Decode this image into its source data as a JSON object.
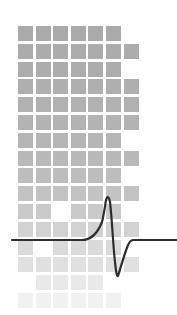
{
  "graphic": {
    "description": "Grid of gray squares fading toward bottom with a spike waveform line",
    "grid": {
      "left": 18,
      "top": 26,
      "pitch_x": 17.6,
      "pitch_y": 17.8,
      "size": 15,
      "rows": [
        {
          "cols": [
            0,
            1,
            2,
            3,
            4,
            5
          ],
          "shade": "#aaaaaa"
        },
        {
          "cols": [
            0,
            1,
            2,
            3,
            4,
            5,
            6
          ],
          "shade": "#acacac"
        },
        {
          "cols": [
            0,
            1,
            2,
            3,
            4,
            5
          ],
          "shade": "#adadad"
        },
        {
          "cols": [
            0,
            1,
            2,
            3,
            4,
            5,
            6
          ],
          "shade": "#afafaf"
        },
        {
          "cols": [
            0,
            1,
            2,
            3,
            4,
            5,
            6
          ],
          "shade": "#b1b1b1"
        },
        {
          "cols": [
            0,
            1,
            2,
            3,
            4,
            5,
            6
          ],
          "shade": "#b3b3b3"
        },
        {
          "cols": [
            0,
            1,
            2,
            3,
            4,
            5
          ],
          "shade": "#b6b6b6"
        },
        {
          "cols": [
            0,
            1,
            2,
            3,
            4,
            5,
            6
          ],
          "shade": "#b9b9b9"
        },
        {
          "cols": [
            0,
            1,
            2,
            3,
            4,
            5
          ],
          "shade": "#bdbdbd"
        },
        {
          "cols": [
            0,
            1,
            2,
            3,
            4,
            5,
            6
          ],
          "shade": "#c3c3c3"
        },
        {
          "cols": [
            0,
            1,
            3,
            4,
            5
          ],
          "shade": "#cacaca"
        },
        {
          "cols": [
            0,
            1,
            2,
            3,
            4,
            5,
            6
          ],
          "shade": "#d2d2d2"
        },
        {
          "cols": [
            0,
            2,
            3,
            4,
            5
          ],
          "shade": "#dadada"
        },
        {
          "cols": [
            0,
            1,
            2,
            3,
            4,
            5,
            6
          ],
          "shade": "#e0e0e0"
        },
        {
          "cols": [
            1,
            2,
            3,
            4
          ],
          "shade": "#e9e9e9"
        },
        {
          "cols": [
            0,
            1,
            2,
            3,
            4,
            5
          ],
          "shade": "#f1f1f1"
        }
      ]
    },
    "waveform": {
      "color": "#2e2e2e",
      "stroke_width": 2.2,
      "path": "M12,240 L82,240 C92,240 98,232 102,222 C104,214 105,206 106,200 C107,196 109,196 110,202 C112,218 113,245 115,262 C116,272 117,277 118,276 C120,270 124,255 128,245 C130,241 131,240 134,240 L177,240"
    }
  }
}
